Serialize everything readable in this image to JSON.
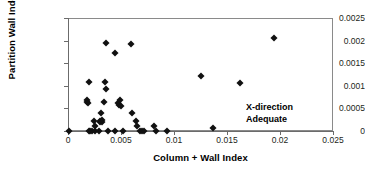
{
  "chart_data": {
    "type": "scatter",
    "title": "",
    "xlabel": "Column + Wall Index",
    "ylabel": "Partition Wall Index",
    "xlim": [
      0,
      0.025
    ],
    "ylim": [
      0,
      0.0025
    ],
    "xticks": [
      "0",
      "0.005",
      "0.01",
      "0.015",
      "0.02",
      "0.025"
    ],
    "xtick_values": [
      0,
      0.005,
      0.01,
      0.015,
      0.02,
      0.025
    ],
    "yticks": [
      "0",
      "0.0005",
      "0.001",
      "0.0015",
      "0.002",
      "0.0025"
    ],
    "ytick_values": [
      0,
      0.0005,
      0.001,
      0.0015,
      0.002,
      0.0025
    ],
    "grid": false,
    "legend": null,
    "marker": "filled-diamond",
    "marker_color": "#111111",
    "annotations": [
      {
        "text_line1": "X-direction",
        "text_line2": "Adequate",
        "x": 0.0168,
        "y": 0.00052
      }
    ],
    "series": [
      {
        "name": "Buildings",
        "points": [
          [
            5e-05,
            0.0
          ],
          [
            0.00175,
            0.00069
          ],
          [
            0.0018,
            0.00065
          ],
          [
            0.00185,
            0.00062
          ],
          [
            0.00195,
            0.00108
          ],
          [
            0.002,
            0.0
          ],
          [
            0.0021,
            0.0
          ],
          [
            0.00225,
            0.0
          ],
          [
            0.00245,
            0.00022
          ],
          [
            0.0025,
            0.0
          ],
          [
            0.00255,
            0.00012
          ],
          [
            0.0029,
            0.0
          ],
          [
            0.003,
            0.00019
          ],
          [
            0.00305,
            0.00023
          ],
          [
            0.0031,
            0.0004
          ],
          [
            0.0032,
            0.00024
          ],
          [
            0.00325,
            0.00021
          ],
          [
            0.0034,
            0.00065
          ],
          [
            0.0035,
            0.00108
          ],
          [
            0.00355,
            0.00092
          ],
          [
            0.0036,
            0.00195
          ],
          [
            0.00375,
            0.0
          ],
          [
            0.0044,
            0.00172
          ],
          [
            0.0044,
            0.0
          ],
          [
            0.0047,
            0.00062
          ],
          [
            0.0048,
            0.00057
          ],
          [
            0.0049,
            0.00068
          ],
          [
            0.005,
            0.00055
          ],
          [
            0.0052,
            0.0
          ],
          [
            0.00595,
            0.00193
          ],
          [
            0.006,
            0.0004
          ],
          [
            0.0064,
            0.00023
          ],
          [
            0.00655,
            0.0001
          ],
          [
            0.0068,
            0.0
          ],
          [
            0.007,
            0.0
          ],
          [
            0.0072,
            0.0
          ],
          [
            0.0081,
            0.00012
          ],
          [
            0.0083,
            0.0
          ],
          [
            0.0093,
            0.0
          ],
          [
            0.0125,
            0.00122
          ],
          [
            0.0137,
            6e-05
          ],
          [
            0.0162,
            0.00106
          ],
          [
            0.0194,
            0.00206
          ]
        ]
      }
    ]
  },
  "axis_geometry": {
    "plot_left_px": 68,
    "plot_top_px": 18,
    "plot_width_px": 265,
    "plot_height_px": 113
  }
}
